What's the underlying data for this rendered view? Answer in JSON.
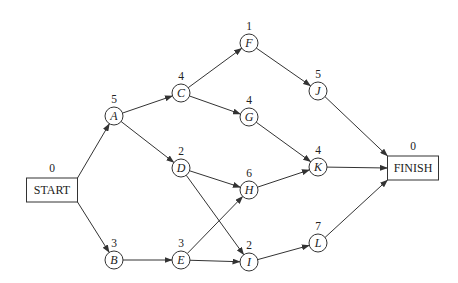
{
  "diagram": {
    "type": "activity-on-node network",
    "nodes": [
      {
        "id": "START",
        "label": "START",
        "duration": "0",
        "shape": "box",
        "x": 52,
        "y": 190,
        "w": 51,
        "h": 24
      },
      {
        "id": "A",
        "label": "A",
        "duration": "5",
        "shape": "circle",
        "x": 114,
        "y": 116
      },
      {
        "id": "B",
        "label": "B",
        "duration": "3",
        "shape": "circle",
        "x": 114,
        "y": 260
      },
      {
        "id": "C",
        "label": "C",
        "duration": "4",
        "shape": "circle",
        "x": 181,
        "y": 93
      },
      {
        "id": "D",
        "label": "D",
        "duration": "2",
        "shape": "circle",
        "x": 181,
        "y": 168
      },
      {
        "id": "E",
        "label": "E",
        "duration": "3",
        "shape": "circle",
        "x": 181,
        "y": 260
      },
      {
        "id": "F",
        "label": "F",
        "duration": "1",
        "shape": "circle",
        "x": 249,
        "y": 43
      },
      {
        "id": "G",
        "label": "G",
        "duration": "4",
        "shape": "circle",
        "x": 249,
        "y": 117
      },
      {
        "id": "H",
        "label": "H",
        "duration": "6",
        "shape": "circle",
        "x": 249,
        "y": 190
      },
      {
        "id": "I",
        "label": "I",
        "duration": "2",
        "shape": "circle",
        "x": 249,
        "y": 262
      },
      {
        "id": "J",
        "label": "J",
        "duration": "5",
        "shape": "circle",
        "x": 318,
        "y": 91
      },
      {
        "id": "K",
        "label": "K",
        "duration": "4",
        "shape": "circle",
        "x": 318,
        "y": 167
      },
      {
        "id": "L",
        "label": "L",
        "duration": "7",
        "shape": "circle",
        "x": 318,
        "y": 243
      },
      {
        "id": "FINISH",
        "label": "FINISH",
        "duration": "0",
        "shape": "box",
        "x": 413,
        "y": 168,
        "w": 51,
        "h": 24
      }
    ],
    "edges": [
      {
        "from": "START",
        "to": "A"
      },
      {
        "from": "START",
        "to": "B"
      },
      {
        "from": "A",
        "to": "C"
      },
      {
        "from": "A",
        "to": "D"
      },
      {
        "from": "B",
        "to": "E"
      },
      {
        "from": "C",
        "to": "F"
      },
      {
        "from": "C",
        "to": "G"
      },
      {
        "from": "D",
        "to": "H"
      },
      {
        "from": "D",
        "to": "I"
      },
      {
        "from": "E",
        "to": "H"
      },
      {
        "from": "E",
        "to": "I"
      },
      {
        "from": "F",
        "to": "J"
      },
      {
        "from": "G",
        "to": "K"
      },
      {
        "from": "H",
        "to": "K"
      },
      {
        "from": "I",
        "to": "L"
      },
      {
        "from": "J",
        "to": "FINISH"
      },
      {
        "from": "K",
        "to": "FINISH"
      },
      {
        "from": "L",
        "to": "FINISH"
      }
    ]
  },
  "colors": {
    "stroke": "#333333",
    "text": "#222222",
    "background": "#ffffff"
  }
}
